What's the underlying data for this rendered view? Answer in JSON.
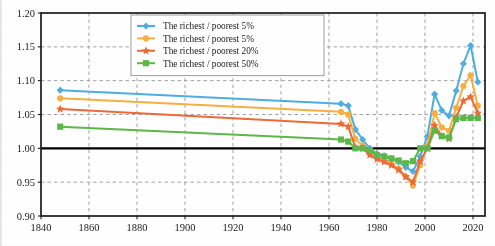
{
  "chart_data": {
    "type": "line",
    "title": "",
    "subtitle": "",
    "xlabel": "",
    "ylabel": "",
    "xlim": [
      1840,
      2025
    ],
    "ylim": [
      0.9,
      1.2
    ],
    "xticks": [
      1840,
      1860,
      1880,
      1900,
      1920,
      1940,
      1960,
      1980,
      2000,
      2020
    ],
    "xtick_labels": [
      "1840",
      "1860",
      "1880",
      "1900",
      "1920",
      "1940",
      "1960",
      "1980",
      "2000",
      "2020"
    ],
    "yticks": [
      0.9,
      0.95,
      1.0,
      1.05,
      1.1,
      1.15,
      1.2
    ],
    "ytick_labels": [
      "0.90",
      "0.95",
      "1.00",
      "1.05",
      "1.10",
      "1.15",
      "1.20"
    ],
    "grid": true,
    "grid_style": "dashed",
    "reference_line_y": 1.0,
    "legend_position": "top-center",
    "series": [
      {
        "name": "The richest / poorest 5%",
        "color": "#4FAEE0",
        "marker": "diamond",
        "x": [
          1848,
          1965,
          1968,
          1971,
          1974,
          1977,
          1980,
          1983,
          1986,
          1989,
          1992,
          1995,
          1998,
          2001,
          2004,
          2007,
          2010,
          2013,
          2016,
          2019,
          2022
        ],
        "values": [
          1.086,
          1.066,
          1.063,
          1.028,
          1.013,
          1.0,
          0.992,
          0.989,
          0.985,
          0.98,
          0.972,
          0.966,
          0.988,
          1.018,
          1.08,
          1.056,
          1.048,
          1.085,
          1.125,
          1.152,
          1.098
        ]
      },
      {
        "name": "The richest / poorest 5%",
        "color": "#F5B041",
        "marker": "circle",
        "x": [
          1848,
          1965,
          1968,
          1971,
          1974,
          1977,
          1980,
          1983,
          1986,
          1989,
          1992,
          1995,
          1998,
          2001,
          2004,
          2007,
          2010,
          2013,
          2016,
          2019,
          2022
        ],
        "values": [
          1.074,
          1.054,
          1.05,
          1.014,
          1.004,
          0.994,
          0.986,
          0.982,
          0.977,
          0.97,
          0.958,
          0.945,
          0.975,
          1.004,
          1.052,
          1.031,
          1.026,
          1.06,
          1.092,
          1.108,
          1.063
        ]
      },
      {
        "name": "The richest / poorest 20%",
        "color": "#ED6A36",
        "marker": "star",
        "x": [
          1848,
          1965,
          1968,
          1971,
          1974,
          1977,
          1980,
          1983,
          1986,
          1989,
          1992,
          1995,
          1998,
          2001,
          2004,
          2007,
          2010,
          2013,
          2016,
          2019,
          2022
        ],
        "values": [
          1.058,
          1.036,
          1.032,
          1.001,
          1.0,
          0.99,
          0.984,
          0.98,
          0.975,
          0.968,
          0.958,
          0.95,
          0.981,
          1.0,
          1.034,
          1.018,
          1.014,
          1.046,
          1.07,
          1.076,
          1.052
        ]
      },
      {
        "name": "The richest / poorest 50%",
        "color": "#5CB84A",
        "marker": "square",
        "x": [
          1848,
          1965,
          1968,
          1971,
          1974,
          1977,
          1980,
          1983,
          1986,
          1989,
          1992,
          1995,
          1998,
          2001,
          2004,
          2007,
          2010,
          2013,
          2016,
          2019,
          2022
        ],
        "values": [
          1.032,
          1.013,
          1.01,
          1.0,
          1.0,
          0.997,
          0.99,
          0.988,
          0.985,
          0.982,
          0.978,
          0.981,
          1.0,
          1.0,
          1.026,
          1.018,
          1.016,
          1.043,
          1.045,
          1.045,
          1.045
        ]
      }
    ]
  },
  "legend": {
    "items": [
      {
        "label": "The richest / poorest 5%",
        "color": "#4FAEE0",
        "marker": "diamond"
      },
      {
        "label": "The richest / poorest 5%",
        "color": "#F5B041",
        "marker": "circle"
      },
      {
        "label": "The richest / poorest 20%",
        "color": "#ED6A36",
        "marker": "star"
      },
      {
        "label": "The richest / poorest 50%",
        "color": "#5CB84A",
        "marker": "square"
      }
    ]
  },
  "colors": {
    "axis": "#1c1c1c",
    "grid": "#9a9a9a",
    "reference_line": "#000000",
    "background": "#ffffff",
    "legend_border": "#9e9e9e"
  }
}
